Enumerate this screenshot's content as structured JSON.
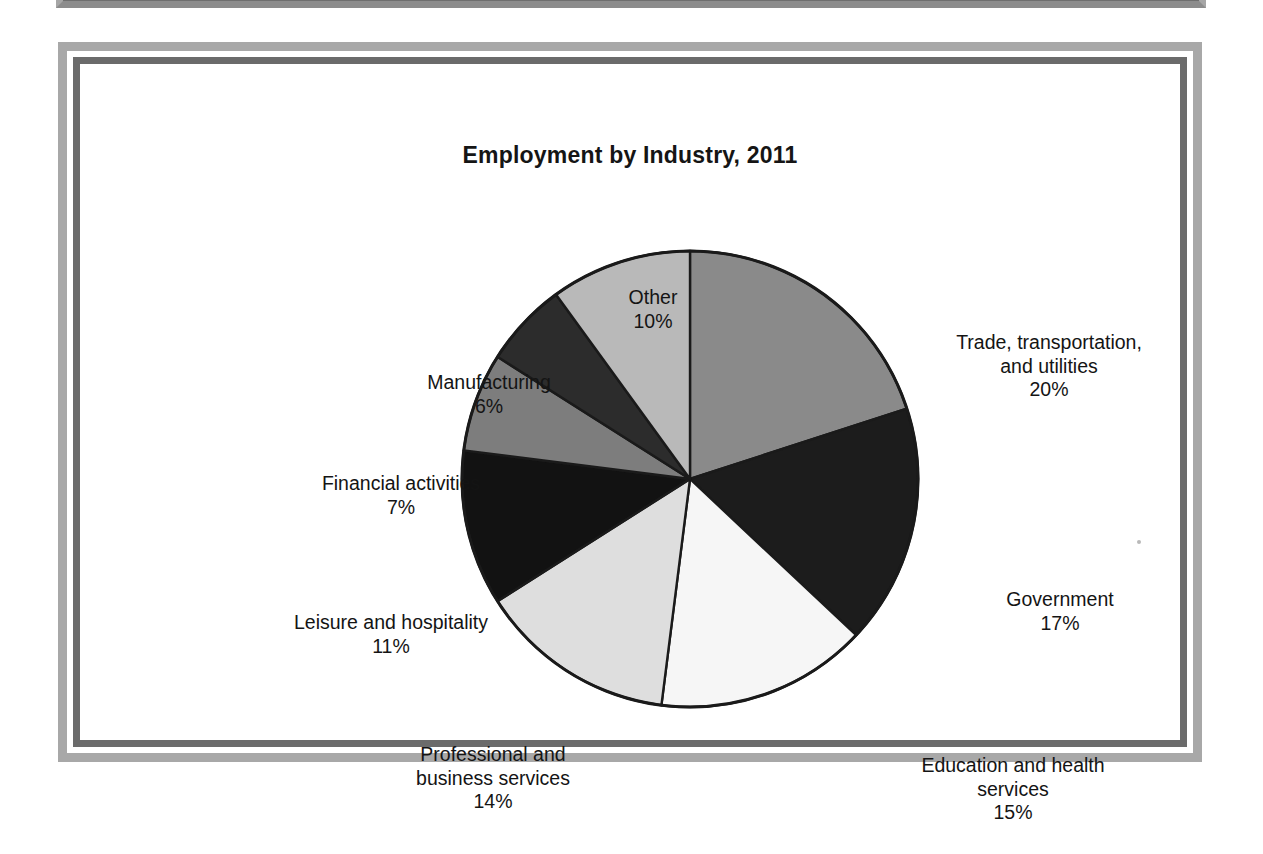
{
  "figure": {
    "title": "Employment by Industry, 2011"
  },
  "chart_data": {
    "type": "pie",
    "title": "Employment by Industry, 2011",
    "xlabel": "",
    "ylabel": "",
    "units": "percent",
    "start_angle_deg": 0,
    "direction": "clockwise",
    "legend": "none (direct labels with leader-free placement around pie)",
    "grid": false,
    "total": 100,
    "categories": [
      "Trade, transportation, and utilities",
      "Government",
      "Education and health services",
      "Professional and business services",
      "Leisure and hospitality",
      "Financial activities",
      "Manufacturing",
      "Other"
    ],
    "values": [
      20,
      17,
      15,
      14,
      11,
      7,
      6,
      10
    ],
    "colors": [
      "#8a8a8a",
      "#1c1c1c",
      "#f6f6f6",
      "#dedede",
      "#121212",
      "#7d7d7d",
      "#2c2c2c",
      "#b9b9b9"
    ],
    "slices": [
      {
        "label": "Trade, transportation,\nand utilities",
        "name": "Trade, transportation, and utilities",
        "value": 20,
        "percent": "20%",
        "color": "#8a8a8a"
      },
      {
        "label": "Government",
        "name": "Government",
        "value": 17,
        "percent": "17%",
        "color": "#1c1c1c"
      },
      {
        "label": "Education and health\nservices",
        "name": "Education and health services",
        "value": 15,
        "percent": "15%",
        "color": "#f6f6f6"
      },
      {
        "label": "Professional and\nbusiness services",
        "name": "Professional and business services",
        "value": 14,
        "percent": "14%",
        "color": "#dedede"
      },
      {
        "label": "Leisure and hospitality",
        "name": "Leisure and hospitality",
        "value": 11,
        "percent": "11%",
        "color": "#121212"
      },
      {
        "label": "Financial activities",
        "name": "Financial activities",
        "value": 7,
        "percent": "7%",
        "color": "#7d7d7d"
      },
      {
        "label": "Manufacturing",
        "name": "Manufacturing",
        "value": 6,
        "percent": "6%",
        "color": "#2c2c2c"
      },
      {
        "label": "Other",
        "name": "Other",
        "value": 10,
        "percent": "10%",
        "color": "#b9b9b9"
      }
    ]
  },
  "labels": {
    "trade": {
      "name": "Trade, transportation,\nand utilities",
      "percent": "20%"
    },
    "government": {
      "name": "Government",
      "percent": "17%"
    },
    "education": {
      "name": "Education and health\nservices",
      "percent": "15%"
    },
    "professional": {
      "name": "Professional and\nbusiness services",
      "percent": "14%"
    },
    "leisure": {
      "name": "Leisure and hospitality",
      "percent": "11%"
    },
    "financial": {
      "name": "Financial activities",
      "percent": "7%"
    },
    "manufacturing": {
      "name": "Manufacturing",
      "percent": "6%"
    },
    "other": {
      "name": "Other",
      "percent": "10%"
    }
  }
}
